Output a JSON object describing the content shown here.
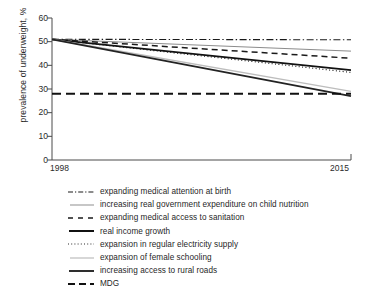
{
  "chart_data": {
    "type": "line",
    "title": "",
    "subtitle": "",
    "xlabel": "",
    "ylabel": "prevalence of underweight, %",
    "xlim": [
      1998,
      2015
    ],
    "ylim": [
      0,
      60
    ],
    "x_tick_labels": [
      "1998",
      "2015"
    ],
    "y_tick_labels": [
      "0",
      "10",
      "20",
      "30",
      "40",
      "50",
      "60"
    ],
    "y_ticks": [
      0,
      10,
      20,
      30,
      40,
      50,
      60
    ],
    "grid": false,
    "legend_position": "below",
    "x": [
      1998,
      2015
    ],
    "series": [
      {
        "name": "expanding medical attention at birth",
        "values": [
          51,
          50.8
        ],
        "style": "dash-dot",
        "color": "#1a1a1a",
        "width": 1.1
      },
      {
        "name": "increasing real government expenditure on child nutrition",
        "values": [
          51,
          46
        ],
        "style": "solid",
        "color": "#8c8c8c",
        "width": 1.0
      },
      {
        "name": "expanding medical access to sanitation",
        "values": [
          51,
          43
        ],
        "style": "dashed",
        "color": "#1a1a1a",
        "width": 1.5
      },
      {
        "name": "real income growth",
        "values": [
          51,
          38
        ],
        "style": "solid",
        "color": "#111111",
        "width": 1.8
      },
      {
        "name": "expansion in regular electricity supply",
        "values": [
          51,
          37
        ],
        "style": "dotted",
        "color": "#1a1a1a",
        "width": 1.2
      },
      {
        "name": "expansion of female schooling",
        "values": [
          51,
          29
        ],
        "style": "solid",
        "color": "#bdbdbd",
        "width": 1.4
      },
      {
        "name": "increasing access to rural roads",
        "values": [
          51,
          27
        ],
        "style": "solid",
        "color": "#232323",
        "width": 1.7
      },
      {
        "name": "MDG",
        "values": [
          28,
          28
        ],
        "style": "long-dash",
        "color": "#111111",
        "width": 1.8
      }
    ]
  },
  "axes": {
    "y_label": "prevalence of underweight, %",
    "y_tick_labels": [
      "60",
      "50",
      "40",
      "30",
      "20",
      "10",
      "0"
    ],
    "x_tick_start": "1998",
    "x_tick_end": "2015"
  },
  "legend": {
    "items": [
      {
        "label": "expanding medical attention at birth",
        "swatch": "dash-dot-line-swatch"
      },
      {
        "label": "increasing real government expenditure on child nutrition",
        "swatch": "thin-gray-line-swatch"
      },
      {
        "label": "expanding medical access to sanitation",
        "swatch": "dashed-line-swatch"
      },
      {
        "label": "real income growth",
        "swatch": "thick-solid-line-swatch"
      },
      {
        "label": "expansion in regular electricity supply",
        "swatch": "dotted-line-swatch"
      },
      {
        "label": "expansion of female schooling",
        "swatch": "light-gray-line-swatch"
      },
      {
        "label": "increasing access to rural roads",
        "swatch": "solid-line-swatch"
      },
      {
        "label": "MDG",
        "swatch": "long-dash-line-swatch"
      }
    ]
  }
}
